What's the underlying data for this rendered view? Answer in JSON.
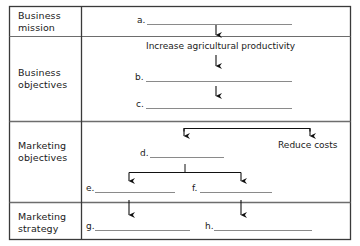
{
  "diagram": {
    "colors": {
      "border": "#3a3a3a",
      "inner_rule": "#6d6d6d",
      "blank_line": "#8a8a8a",
      "arrow": "#111111",
      "text": "#1a1a1a",
      "background": "#ffffff"
    },
    "rows": [
      {
        "id": "business-mission",
        "label": "Business\nmission"
      },
      {
        "id": "business-objectives",
        "label": "Business\nobjectives"
      },
      {
        "id": "marketing-objectives",
        "label": "Marketing\nobjectives"
      },
      {
        "id": "marketing-strategy",
        "label": "Marketing\nstrategy"
      }
    ],
    "blanks": [
      {
        "id": "blank-a",
        "tag": "a.",
        "row": "business-mission"
      },
      {
        "id": "blank-b",
        "tag": "b.",
        "row": "business-objectives"
      },
      {
        "id": "blank-c",
        "tag": "c.",
        "row": "business-objectives"
      },
      {
        "id": "blank-d",
        "tag": "d.",
        "row": "marketing-objectives"
      },
      {
        "id": "blank-e",
        "tag": "e.",
        "row": "marketing-objectives"
      },
      {
        "id": "blank-f",
        "tag": "f.",
        "row": "marketing-objectives"
      },
      {
        "id": "blank-g",
        "tag": "g.",
        "row": "marketing-strategy"
      },
      {
        "id": "blank-h",
        "tag": "h.",
        "row": "marketing-strategy"
      }
    ],
    "annotations": [
      {
        "id": "annotation-increase-productivity",
        "text": "Increase agricultural productivity",
        "row": "business-objectives"
      },
      {
        "id": "annotation-reduce-costs",
        "text": "Reduce costs",
        "row": "marketing-objectives"
      }
    ]
  }
}
